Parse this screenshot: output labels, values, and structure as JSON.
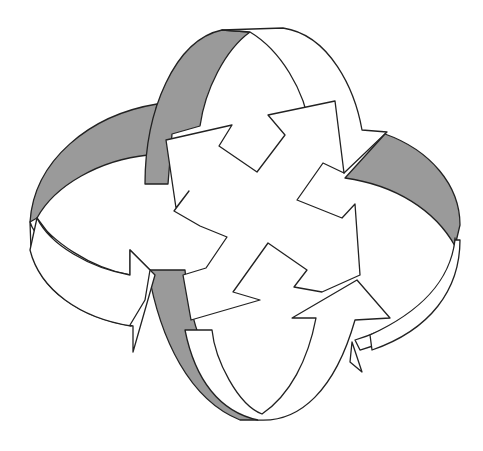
{
  "figure": {
    "title": "",
    "colors": {
      "background": "#ffffff",
      "ribbon_shade": "#9a9a9a",
      "ribbon_face": "#ffffff",
      "outline": "#222222"
    },
    "elements": [
      {
        "id": "ring-vertical-top",
        "type": "curved-arrow"
      },
      {
        "id": "ring-horizontal-right",
        "type": "curved-arrow"
      },
      {
        "id": "ring-vertical-bottom",
        "type": "curved-arrow"
      },
      {
        "id": "ring-horizontal-left",
        "type": "curved-arrow"
      },
      {
        "id": "center-cross",
        "type": "four-way-arrow"
      }
    ]
  }
}
